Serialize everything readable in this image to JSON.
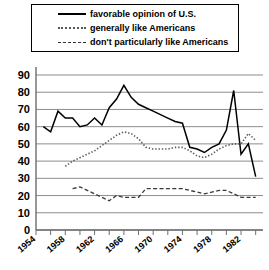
{
  "legend": {
    "items": [
      {
        "label": "favorable opinion of U.S.",
        "style": "solid",
        "icon": "solid-line-icon"
      },
      {
        "label": "generally like Americans",
        "style": "dotted",
        "icon": "dotted-line-icon"
      },
      {
        "label": "don't particularly like Americans",
        "style": "dashed",
        "icon": "dashed-line-icon"
      }
    ]
  },
  "chart_data": {
    "type": "line",
    "title": "",
    "xlabel": "",
    "ylabel": "",
    "xlim": [
      1954,
      1985
    ],
    "ylim": [
      0,
      90
    ],
    "grid": true,
    "legend_position": "top",
    "y_ticks": [
      0,
      10,
      20,
      30,
      40,
      50,
      60,
      70,
      80,
      90
    ],
    "x_ticks": [
      1954,
      1956,
      1958,
      1960,
      1962,
      1964,
      1966,
      1968,
      1970,
      1972,
      1974,
      1976,
      1978,
      1980,
      1982,
      1984
    ],
    "x_tick_labels": [
      "1954",
      "1958",
      "1962",
      "1966",
      "1970",
      "1974",
      "1978",
      "1982"
    ],
    "x_tick_labels_years": [
      1954,
      1958,
      1962,
      1966,
      1970,
      1974,
      1978,
      1982
    ],
    "series": [
      {
        "name": "favorable opinion of U.S.",
        "style": "solid",
        "color": "#000000",
        "x": [
          1955,
          1956,
          1957,
          1958,
          1959,
          1960,
          1961,
          1962,
          1963,
          1964,
          1965,
          1966,
          1967,
          1968,
          1969,
          1970,
          1971,
          1972,
          1973,
          1974,
          1975,
          1976,
          1977,
          1978,
          1979,
          1980,
          1981,
          1982,
          1983,
          1984
        ],
        "values": [
          60,
          57,
          69,
          65,
          65,
          60,
          61,
          65,
          61,
          71,
          76,
          84,
          77,
          73,
          71,
          69,
          67,
          65,
          63,
          62,
          48,
          47,
          45,
          48,
          50,
          58,
          81,
          44,
          50,
          31
        ]
      },
      {
        "name": "generally like Americans",
        "style": "dotted",
        "color": "#5a5a5a",
        "x": [
          1958,
          1959,
          1960,
          1961,
          1962,
          1963,
          1964,
          1965,
          1966,
          1967,
          1968,
          1969,
          1970,
          1971,
          1972,
          1973,
          1974,
          1975,
          1976,
          1977,
          1978,
          1979,
          1980,
          1981,
          1982,
          1983,
          1984
        ],
        "values": [
          37,
          40,
          42,
          44,
          46,
          49,
          52,
          55,
          57,
          56,
          53,
          48,
          47,
          47,
          47,
          48,
          48,
          46,
          43,
          42,
          44,
          47,
          49,
          50,
          50,
          56,
          52
        ]
      },
      {
        "name": "don't particularly like Americans",
        "style": "dashed",
        "color": "#3a3a3a",
        "x": [
          1959,
          1960,
          1961,
          1962,
          1963,
          1964,
          1965,
          1966,
          1967,
          1968,
          1969,
          1970,
          1971,
          1972,
          1973,
          1974,
          1975,
          1976,
          1977,
          1978,
          1979,
          1980,
          1981,
          1982,
          1983,
          1984
        ],
        "values": [
          24,
          25,
          23,
          21,
          19,
          17,
          20,
          19,
          19,
          19,
          24,
          24,
          24,
          24,
          24,
          24,
          23,
          22,
          21,
          22,
          23,
          23,
          21,
          19,
          19,
          19
        ]
      }
    ]
  }
}
